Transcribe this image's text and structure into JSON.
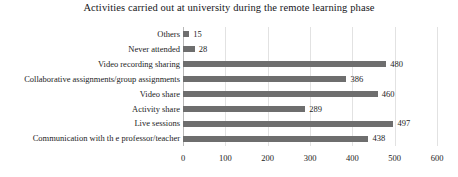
{
  "chart_data": {
    "type": "bar",
    "orientation": "horizontal",
    "title": "Activities carried out at university during the remote learning phase",
    "xlabel": "",
    "ylabel": "",
    "categories": [
      "Others",
      "Never attended",
      "Video recording sharing",
      "Collaborative assignments/group assignments",
      "Video share",
      "Activity share",
      "Live sessions",
      "Communication with th e professor/teacher"
    ],
    "values": [
      15,
      28,
      480,
      386,
      460,
      289,
      497,
      438
    ],
    "data_labels": [
      "15",
      "28",
      "480",
      "386",
      "460",
      "289",
      "497",
      "438"
    ],
    "xlim": [
      0,
      600
    ],
    "xticks": [
      0,
      100,
      200,
      300,
      400,
      500,
      600
    ],
    "xtick_labels": [
      "0",
      "100",
      "200",
      "300",
      "400",
      "500",
      "600"
    ],
    "grid": true,
    "legend": false,
    "bar_color": "#6e6e6e",
    "gridline_color": "#e2e2e2",
    "axis_color": "#b9b9b9",
    "background_color": "#ffffff"
  }
}
